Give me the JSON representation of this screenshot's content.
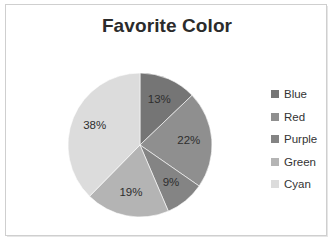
{
  "chart_data": {
    "type": "pie",
    "title": "Favorite Color",
    "categories": [
      "Blue",
      "Red",
      "Purple",
      "Green",
      "Cyan"
    ],
    "values": [
      13,
      22,
      9,
      19,
      38
    ],
    "value_labels": [
      "13%",
      "22%",
      "9%",
      "19%",
      "38%"
    ],
    "unit": "percent",
    "start_angle_deg": 0,
    "direction": "clockwise",
    "legend_position": "right",
    "grid": false,
    "xlabel": "",
    "ylabel": "",
    "slice_colors": [
      "#757575",
      "#8f8f8f",
      "#848484",
      "#b4b4b4",
      "#dcdcdc"
    ],
    "legend_swatch_colors": [
      "#757575",
      "#8f8f8f",
      "#848484",
      "#b4b4b4",
      "#dcdcdc"
    ],
    "legend": [
      {
        "label": "Blue",
        "color": "#757575",
        "value": 13,
        "value_label": "13%"
      },
      {
        "label": "Red",
        "color": "#8f8f8f",
        "value": 22,
        "value_label": "22%"
      },
      {
        "label": "Purple",
        "color": "#848484",
        "value": 9,
        "value_label": "9%"
      },
      {
        "label": "Green",
        "color": "#b4b4b4",
        "value": 19,
        "value_label": "19%"
      },
      {
        "label": "Cyan",
        "color": "#dcdcdc",
        "value": 38,
        "value_label": "38%"
      }
    ]
  },
  "style": {
    "background": "#ffffff",
    "frame_border": "#cfcfcf",
    "title_color": "#2b2b2b",
    "label_color": "#2e2e2e",
    "legend_text_color": "#333333"
  }
}
